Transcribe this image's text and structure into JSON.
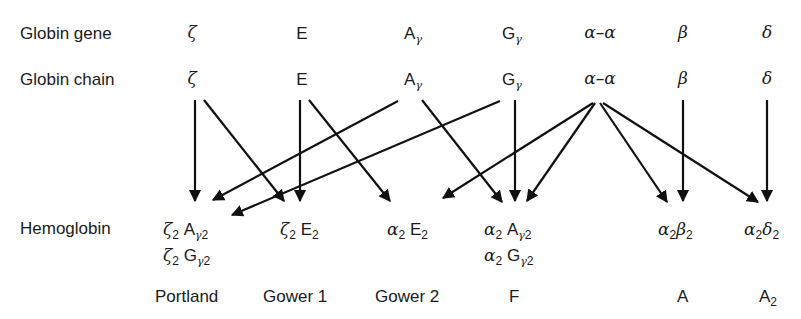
{
  "rows": {
    "gene_label": "Globin gene",
    "chain_label": "Globin chain",
    "hemoglobin_label": "Hemoglobin"
  },
  "genes": [
    {
      "id": "zeta",
      "symbol": "ζ",
      "greek": true
    },
    {
      "id": "E",
      "symbol": "E",
      "greek": false
    },
    {
      "id": "Agamma",
      "symbol": "A",
      "sub": "γ"
    },
    {
      "id": "Ggamma",
      "symbol": "G",
      "sub": "γ"
    },
    {
      "id": "alpha-alpha",
      "symbol": "α–α",
      "greek": true
    },
    {
      "id": "beta",
      "symbol": "β",
      "greek": true
    },
    {
      "id": "delta",
      "symbol": "δ",
      "greek": true
    }
  ],
  "chains": [
    {
      "id": "zeta",
      "symbol": "ζ"
    },
    {
      "id": "E",
      "symbol": "E"
    },
    {
      "id": "Agamma",
      "symbol": "A",
      "sub": "γ"
    },
    {
      "id": "Ggamma",
      "symbol": "G",
      "sub": "γ"
    },
    {
      "id": "alpha-alpha",
      "symbol": "α–α"
    },
    {
      "id": "beta",
      "symbol": "β"
    },
    {
      "id": "delta",
      "symbol": "δ"
    }
  ],
  "hemoglobins": [
    {
      "id": "portland",
      "formulas": [
        "ζ2 Aγ2",
        "ζ2 Gγ2"
      ],
      "name": "Portland"
    },
    {
      "id": "gower1",
      "formulas": [
        "ζ2 E2"
      ],
      "name": "Gower 1"
    },
    {
      "id": "gower2",
      "formulas": [
        "α2 E2"
      ],
      "name": "Gower 2"
    },
    {
      "id": "F",
      "formulas": [
        "α2 Aγ2",
        "α2 Gγ2"
      ],
      "name": "F"
    },
    {
      "id": "A",
      "formulas": [
        "α2β2"
      ],
      "name": "A"
    },
    {
      "id": "A2",
      "formulas": [
        "α2δ2"
      ],
      "name": "A2"
    }
  ],
  "names": {
    "portland": "Portland",
    "gower1": "Gower 1",
    "gower2": "Gower 2",
    "F": "F",
    "A": "A",
    "A2_base": "A",
    "A2_sub": "2"
  },
  "edges": [
    {
      "from": "zeta",
      "to": "portland"
    },
    {
      "from": "zeta",
      "to": "gower1"
    },
    {
      "from": "E",
      "to": "gower1"
    },
    {
      "from": "E",
      "to": "gower2"
    },
    {
      "from": "Agamma",
      "to": "portland"
    },
    {
      "from": "Agamma",
      "to": "F"
    },
    {
      "from": "Ggamma",
      "to": "portland"
    },
    {
      "from": "Ggamma",
      "to": "F"
    },
    {
      "from": "alpha-alpha",
      "to": "gower2"
    },
    {
      "from": "alpha-alpha",
      "to": "F"
    },
    {
      "from": "alpha-alpha",
      "to": "A"
    },
    {
      "from": "alpha-alpha",
      "to": "A2"
    },
    {
      "from": "beta",
      "to": "A"
    },
    {
      "from": "delta",
      "to": "A2"
    }
  ],
  "sym": {
    "zeta": "ζ",
    "E": "E",
    "A": "A",
    "G": "G",
    "gamma": "γ",
    "alphaalpha": "α–α",
    "beta": "β",
    "delta": "δ",
    "alpha": "α",
    "two": "2"
  }
}
